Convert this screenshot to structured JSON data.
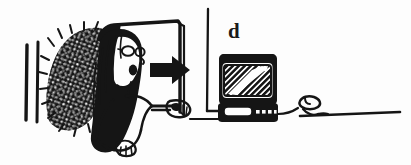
{
  "figure": {
    "panel_label": "d",
    "caption_text": "",
    "background_color": "#fdfdfd",
    "ink_color": "#151515",
    "medium": "black-and-white line drawing",
    "scene_description": "A long-haired person wearing glasses stands in a doorway beside a hedge, reaching a hand toward a mouse on a desk; a bold arrow points right toward a computer monitor with a mouse beside it."
  },
  "elements": {
    "panel_label": {
      "name": "d",
      "position": "top-right-of-center"
    },
    "hedge": {
      "name": "hedge-hatching",
      "description": "dense crosshatched bush texture at left"
    },
    "wall_lines": {
      "name": "wall-edge-lines",
      "count": 2,
      "description": "two vertical strokes at far left"
    },
    "doorway": {
      "name": "doorway-frame",
      "description": "open door outline behind the figure"
    },
    "person": {
      "name": "person-figure",
      "features": [
        "long hair",
        "glasses",
        "open mouth",
        "outstretched arm",
        "hand"
      ]
    },
    "arrow": {
      "name": "direction-arrow",
      "direction": "right"
    },
    "left_mouse": {
      "name": "mouse-left",
      "description": "mouse under the person's hand"
    },
    "vertical_divider": {
      "name": "wall-corner-line",
      "description": "thin vertical line separating the two halves"
    },
    "monitor": {
      "name": "computer-monitor",
      "screen": "diagonal hatching with white swoosh",
      "base_slot": "drive-slot",
      "indicator_count": 4
    },
    "right_mouse": {
      "name": "mouse-right",
      "description": "mouse on the desk connected by a cord"
    },
    "desk_line": {
      "name": "desk-surface-line",
      "description": "horizontal line extending to the right edge"
    }
  }
}
